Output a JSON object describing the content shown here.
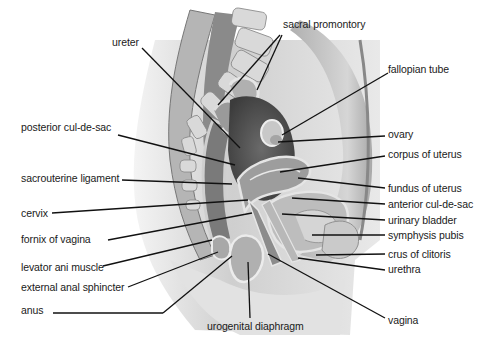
{
  "figure": {
    "type": "anatomical-illustration",
    "labels_left": [
      {
        "id": "ureter",
        "text": "ureter",
        "x": 112,
        "y": 36
      },
      {
        "id": "posterior-cul-de-sac",
        "text": "posterior cul-de-sac",
        "x": 21,
        "y": 121
      },
      {
        "id": "sacrouterine-ligament",
        "text": "sacrouterine ligament",
        "x": 21,
        "y": 172
      },
      {
        "id": "cervix",
        "text": "cervix",
        "x": 21,
        "y": 207
      },
      {
        "id": "fornix-of-vagina",
        "text": "fornix of vagina",
        "x": 21,
        "y": 233
      },
      {
        "id": "levator-ani-muscle",
        "text": "levator ani muscle",
        "x": 21,
        "y": 261
      },
      {
        "id": "external-anal-sphincter",
        "text": "external anal sphincter",
        "x": 21,
        "y": 281
      },
      {
        "id": "anus",
        "text": "anus",
        "x": 21,
        "y": 304
      }
    ],
    "labels_right": [
      {
        "id": "sacral-promontory",
        "text": "sacral promontory",
        "x": 283,
        "y": 18
      },
      {
        "id": "fallopian-tube",
        "text": "fallopian tube",
        "x": 388,
        "y": 63
      },
      {
        "id": "ovary",
        "text": "ovary",
        "x": 388,
        "y": 128
      },
      {
        "id": "corpus-of-uterus",
        "text": "corpus of uterus",
        "x": 388,
        "y": 148
      },
      {
        "id": "fundus-of-uterus",
        "text": "fundus of uterus",
        "x": 388,
        "y": 182
      },
      {
        "id": "anterior-cul-de-sac",
        "text": "anterior cul-de-sac",
        "x": 388,
        "y": 198
      },
      {
        "id": "urinary-bladder",
        "text": "urinary bladder",
        "x": 388,
        "y": 214
      },
      {
        "id": "symphysis-pubis",
        "text": "symphysis pubis",
        "x": 388,
        "y": 229
      },
      {
        "id": "crus-of-clitoris",
        "text": "crus of clitoris",
        "x": 388,
        "y": 248
      },
      {
        "id": "urethra",
        "text": "urethra",
        "x": 388,
        "y": 263
      },
      {
        "id": "vagina",
        "text": "vagina",
        "x": 388,
        "y": 314
      }
    ],
    "labels_bottom": [
      {
        "id": "urogenital-diaphragm",
        "text": "urogenital diaphragm",
        "x": 207,
        "y": 320
      }
    ]
  }
}
